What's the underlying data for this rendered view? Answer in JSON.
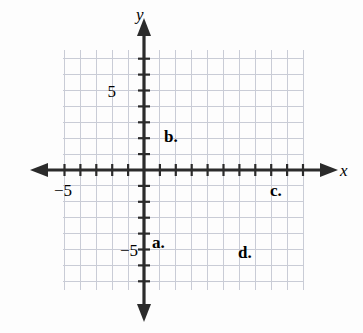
{
  "figure": {
    "background_color": "#fdfdfd",
    "grid_color": "#c9ccd6",
    "axis_color": "#2b2b2b",
    "curve_color": "#4a4a4a",
    "text_color": "#1a1a1a"
  },
  "axes": {
    "x_axis_label": "x",
    "y_axis_label": "y",
    "x_tick_labels": [
      {
        "text": "−5",
        "value": -5
      }
    ],
    "y_tick_labels": [
      {
        "text": "5",
        "value": 5
      },
      {
        "text": "−5",
        "value": -5
      }
    ],
    "origin_px": {
      "x": 144,
      "y": 170
    },
    "unit_px": 15.9,
    "grid_extent_px": {
      "left": 63,
      "right": 303,
      "top": 50,
      "bottom": 290
    },
    "x_range": [
      -5.1,
      10.0
    ],
    "y_range": [
      -7.5,
      7.5
    ],
    "grid": true
  },
  "curve_labels": [
    {
      "id": "a",
      "text": "a.",
      "x_px": 152,
      "y_px": 248
    },
    {
      "id": "b",
      "text": "b.",
      "x_px": 164,
      "y_px": 142
    },
    {
      "id": "c",
      "text": "c.",
      "x_px": 270,
      "y_px": 196
    },
    {
      "id": "d",
      "text": "d.",
      "x_px": 238,
      "y_px": 258
    }
  ],
  "chart_data": {
    "type": "line",
    "title": "",
    "xlabel": "x",
    "ylabel": "y",
    "xlim": [
      -5.1,
      10.0
    ],
    "ylim": [
      -7.5,
      7.5
    ],
    "grid": true,
    "legend": "inline-labels",
    "series": [
      {
        "name": "a",
        "label": "a.",
        "shape": "downward parabola",
        "vertex": [
          0,
          0
        ],
        "leading_coefficient": -1,
        "equation": "y = -x^2",
        "x_intercepts": [
          0
        ],
        "y_intercept": 0
      },
      {
        "name": "b",
        "label": "b.",
        "shape": "downward parabola",
        "vertex": [
          0,
          2
        ],
        "leading_coefficient": -1,
        "equation": "y = -x^2 + 2",
        "x_intercepts": [
          -1.41,
          1.41
        ],
        "y_intercept": 2
      },
      {
        "name": "c",
        "label": "c.",
        "shape": "downward parabola",
        "vertex": [
          6,
          0
        ],
        "leading_coefficient": -1,
        "equation": "y = -(x - 6)^2",
        "x_intercepts": [
          6
        ],
        "y_intercept": -36
      },
      {
        "name": "d",
        "label": "d.",
        "shape": "downward parabola",
        "vertex": [
          6,
          -3
        ],
        "leading_coefficient": -1,
        "equation": "y = -(x - 6)^2 - 3",
        "x_intercepts": [],
        "y_intercept": -39
      }
    ]
  }
}
